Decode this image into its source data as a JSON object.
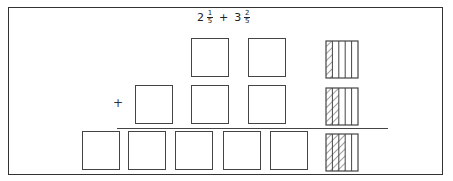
{
  "problem": {
    "whole1": "2",
    "num1": "1",
    "den1": "5",
    "operator": "+",
    "whole2": "3",
    "num2": "2",
    "den2": "5"
  },
  "plus_sign": "+",
  "rows": [
    {
      "wholes": 2,
      "shaded_fifths": 1,
      "box_x": [
        191,
        248
      ],
      "y": 38
    },
    {
      "wholes": 3,
      "shaded_fifths": 2,
      "box_x": [
        135,
        191,
        248
      ],
      "y": 85
    },
    {
      "wholes": 5,
      "shaded_fifths": 3,
      "box_x": [
        82,
        128,
        175,
        223,
        270
      ],
      "y": 131
    }
  ],
  "fraction_bars": [
    {
      "y": 40,
      "shaded": 1,
      "parts": 5
    },
    {
      "y": 87,
      "shaded": 2,
      "parts": 5
    },
    {
      "y": 133,
      "shaded": 3,
      "parts": 5
    }
  ],
  "colors": {
    "line": "#444444"
  }
}
